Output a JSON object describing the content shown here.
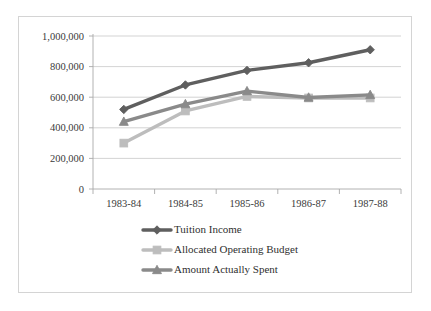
{
  "chart_data": {
    "type": "line",
    "title": "",
    "subtitle": "",
    "xlabel": "",
    "ylabel": "",
    "categories": [
      "1983-84",
      "1984-85",
      "1985-86",
      "1986-87",
      "1987-88"
    ],
    "ylim": [
      0,
      1000000
    ],
    "ytick_labels": [
      "1,000,000",
      "800,000",
      "600,000",
      "400,000",
      "200,000",
      "0"
    ],
    "ytick_values": [
      1000000,
      800000,
      600000,
      400000,
      200000,
      0
    ],
    "grid": true,
    "legend_position": "bottom",
    "series": [
      {
        "name": "Tuition Income",
        "marker": "diamond",
        "color": "#5f5f5f",
        "values": [
          520000,
          680000,
          775000,
          825000,
          910000
        ]
      },
      {
        "name": "Allocated Operating Budget",
        "marker": "square",
        "color": "#bdbdbd",
        "values": [
          300000,
          510000,
          605000,
          595000,
          595000
        ]
      },
      {
        "name": "Amount Actually Spent",
        "marker": "triangle",
        "color": "#8a8a8a",
        "values": [
          440000,
          555000,
          640000,
          598000,
          615000
        ]
      }
    ]
  },
  "legend": {
    "items": [
      {
        "label": "Tuition Income"
      },
      {
        "label": "Allocated Operating Budget"
      },
      {
        "label": "Amount Actually Spent"
      }
    ]
  },
  "colors": {
    "tuition_income": "#5f5f5f",
    "allocated_operating_budget": "#bdbdbd",
    "amount_actually_spent": "#8a8a8a",
    "gridline": "#c8c8c8",
    "axis": "#a9a9a9",
    "border": "#d4d4d4",
    "text": "#3a3a3a",
    "background": "#ffffff"
  }
}
